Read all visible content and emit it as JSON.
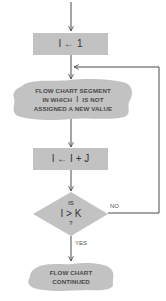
{
  "diagram": {
    "type": "flowchart",
    "colors": {
      "shape_fill": "#c2c2c2",
      "line": "#4a4a4a",
      "text": "#3a3a3a",
      "background": "#ffffff"
    },
    "nodes": {
      "init": {
        "shape": "rectangle",
        "text": "I ← 1"
      },
      "segment": {
        "shape": "cloud",
        "line1": "FLOW CHART SEGMENT",
        "line2_pre": "IN WHICH",
        "line2_var": "I",
        "line2_post": "IS NOT",
        "line3": "ASSIGNED A NEW VALUE"
      },
      "increment": {
        "shape": "rectangle",
        "text": "I ← I + J"
      },
      "decision": {
        "shape": "diamond",
        "line1": "IS",
        "line2": "I > K",
        "line3": "?"
      },
      "continued": {
        "shape": "cloud",
        "line1": "FLOW CHART",
        "line2": "CONTINUED"
      }
    },
    "edges": {
      "no_label": "NO",
      "yes_label": "YES"
    }
  }
}
